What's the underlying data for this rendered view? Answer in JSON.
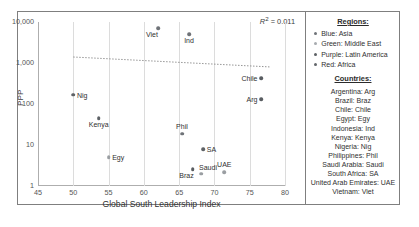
{
  "chart_data": {
    "type": "scatter",
    "title": "",
    "xlabel": "Global South Leadership Index",
    "ylabel": "PPP",
    "xlim": [
      45,
      80
    ],
    "ylim": [
      1,
      10000
    ],
    "yscale": "log",
    "xticks": [
      "45",
      "50",
      "55",
      "60",
      "65",
      "70",
      "75",
      "80"
    ],
    "yticks": [
      "1",
      "10",
      "100",
      "1,000",
      "10,000"
    ],
    "grid": "vertical",
    "annotation": "R² = 0.011",
    "annotation_r": "R",
    "annotation_sup": "2",
    "annotation_rest": " = 0.011",
    "trendline": {
      "type": "dotted-linear",
      "x_start": 50.0,
      "y_start": 1400,
      "x_end": 78.0,
      "y_end": 800
    },
    "points": [
      {
        "label": "Viet",
        "x": 62.0,
        "y": 7000,
        "region": "Asia",
        "color": "#6f7378",
        "label_pos": "below-left"
      },
      {
        "label": "Ind",
        "x": 66.4,
        "y": 5000,
        "region": "Asia",
        "color": "#6f7378",
        "label_pos": "below"
      },
      {
        "label": "Chile",
        "x": 76.6,
        "y": 420,
        "region": "Latin America",
        "color": "#595d61",
        "label_pos": "left"
      },
      {
        "label": "Arg",
        "x": 76.6,
        "y": 130,
        "region": "Latin America",
        "color": "#595d61",
        "label_pos": "left"
      },
      {
        "label": "Nig",
        "x": 50.0,
        "y": 170,
        "region": "Africa",
        "color": "#5e6266",
        "label_pos": "right"
      },
      {
        "label": "Kenya",
        "x": 53.6,
        "y": 45,
        "region": "Africa",
        "color": "#5e6266",
        "label_pos": "below"
      },
      {
        "label": "Phil",
        "x": 65.4,
        "y": 19,
        "region": "Asia",
        "color": "#6f7378",
        "label_pos": "above"
      },
      {
        "label": "Egy",
        "x": 55.0,
        "y": 5.0,
        "region": "Middle East",
        "color": "#9a9ea2",
        "label_pos": "right"
      },
      {
        "label": "SA",
        "x": 68.4,
        "y": 8.0,
        "region": "Africa",
        "color": "#5e6266",
        "label_pos": "right"
      },
      {
        "label": "Saudi",
        "x": 68.1,
        "y": 2.0,
        "region": "Middle East",
        "color": "#9a9ea2",
        "label_pos": "above-right"
      },
      {
        "label": "Braz",
        "x": 66.9,
        "y": 2.6,
        "region": "Latin America",
        "color": "#595d61",
        "label_pos": "below-left"
      },
      {
        "label": "UAE",
        "x": 71.4,
        "y": 2.2,
        "region": "Middle East",
        "color": "#9a9ea2",
        "label_pos": "above"
      }
    ]
  },
  "legend": {
    "regions_heading": "Regions:",
    "regions": [
      {
        "label": "Blue: Asia",
        "color": "#6f7378"
      },
      {
        "label": "Green: Middle East",
        "color": "#a7abaf"
      },
      {
        "label": "Purple: Latin America",
        "color": "#5d6165"
      },
      {
        "label": "Red: Africa",
        "color": "#63676b"
      }
    ],
    "countries_heading": "Countries:",
    "countries": [
      "Argentina: Arg",
      "Brazil: Braz",
      "Chile: Chile",
      "Egypt: Egy",
      "Indonesia: Ind",
      "Kenya: Kenya",
      "Nigeria: Nig",
      "Philippines: Phil",
      "Saudi Arabia: Saudi",
      "South Africa: SA",
      "United Arab Emirates: UAE",
      "Vietnam: Viet"
    ]
  },
  "page_bleed": {
    "text": " "
  }
}
